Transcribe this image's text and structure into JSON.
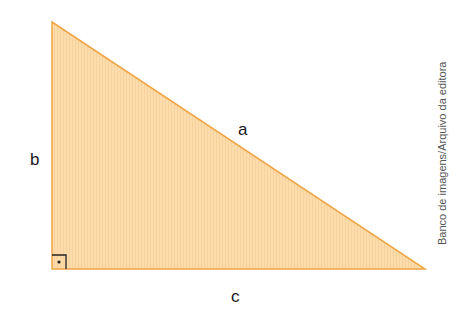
{
  "diagram": {
    "type": "right-triangle",
    "vertices": [
      [
        52,
        22
      ],
      [
        52,
        269
      ],
      [
        425,
        269
      ]
    ],
    "right_angle_vertex": [
      52,
      269
    ],
    "fill_color": "#fcdcab",
    "stroke_color": "#f0a546",
    "labels": {
      "hypotenuse": "a",
      "vertical_leg": "b",
      "horizontal_leg": "c"
    },
    "right_angle_marker": "square-with-dot",
    "credit": "Banco de imagens/Arquivo da editora"
  }
}
